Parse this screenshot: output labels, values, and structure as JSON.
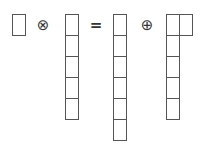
{
  "diagram": {
    "title": "",
    "operators": {
      "tensor": "⊗",
      "equals": "=",
      "direct_sum": "⊕"
    },
    "terms": [
      {
        "name": "single-box",
        "cells": [
          [
            12,
            14
          ]
        ]
      },
      {
        "name": "column-5",
        "cells": [
          [
            65,
            14
          ],
          [
            65,
            35
          ],
          [
            65,
            56
          ],
          [
            65,
            77
          ],
          [
            65,
            98
          ]
        ]
      },
      {
        "name": "column-6",
        "cells": [
          [
            113,
            14
          ],
          [
            113,
            35
          ],
          [
            113,
            56
          ],
          [
            113,
            77
          ],
          [
            113,
            98
          ],
          [
            113,
            119
          ]
        ]
      },
      {
        "name": "hook-2-1-1-1",
        "cells": [
          [
            166,
            14
          ],
          [
            179,
            14
          ],
          [
            166,
            35
          ],
          [
            166,
            56
          ],
          [
            166,
            77
          ],
          [
            166,
            98
          ]
        ]
      }
    ],
    "colors": {
      "stroke": "#555555",
      "background": "#ffffff"
    }
  }
}
